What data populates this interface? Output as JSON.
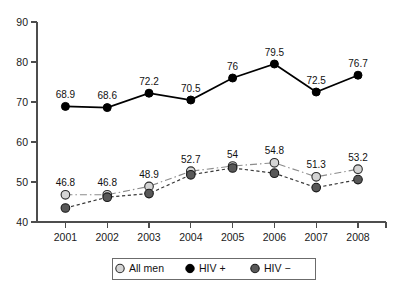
{
  "chart_data": {
    "type": "line",
    "title": "",
    "subtitle": "",
    "xlabel": "",
    "ylabel": "",
    "categories": [
      "2001",
      "2002",
      "2003",
      "2004",
      "2005",
      "2006",
      "2007",
      "2008"
    ],
    "x": [
      2001,
      2002,
      2003,
      2004,
      2005,
      2006,
      2007,
      2008
    ],
    "ylim": [
      40,
      90
    ],
    "xlim": [
      2000.5,
      2008.5
    ],
    "yticks": [
      "40",
      "50",
      "60",
      "70",
      "80",
      "90"
    ],
    "ytick_values": [
      40,
      50,
      60,
      70,
      80,
      90
    ],
    "grid": false,
    "legend_position": "bottom-center",
    "series": [
      {
        "name": "All men",
        "marker": "light-gray-circle",
        "line_style": "dash-dot",
        "color": "#d4d4d4",
        "values": [
          46.8,
          46.8,
          48.9,
          52.7,
          54.0,
          54.8,
          51.3,
          53.2
        ],
        "labels": [
          "46.8",
          "46.8",
          "48.9",
          "52.7",
          "54",
          "54.8",
          "51.3",
          "53.2"
        ],
        "labels_shown": true
      },
      {
        "name": "HIV +",
        "marker": "black-circle",
        "line_style": "solid",
        "color": "#000000",
        "values": [
          68.9,
          68.6,
          72.2,
          70.5,
          76.0,
          79.5,
          72.5,
          76.7
        ],
        "labels": [
          "68.9",
          "68.6",
          "72.2",
          "70.5",
          "76",
          "79.5",
          "72.5",
          "76.7"
        ],
        "labels_shown": true
      },
      {
        "name": "HIV −",
        "marker": "dark-gray-circle",
        "line_style": "dashed",
        "color": "#585858",
        "values": [
          43.5,
          46.2,
          47.1,
          51.8,
          53.5,
          52.2,
          48.6,
          50.6
        ],
        "labels": [],
        "labels_shown": false
      }
    ]
  },
  "legend": {
    "items": [
      {
        "label": "All men",
        "marker": "light-gray-circle"
      },
      {
        "label": "HIV +",
        "marker": "black-circle"
      },
      {
        "label": "HIV −",
        "marker": "dark-gray-circle"
      }
    ]
  },
  "colors": {
    "background": "#ffffff",
    "axis": "#4d4d4d",
    "text": "#111111",
    "all_men": "#d4d4d4",
    "hiv_positive": "#000000",
    "hiv_negative": "#585858",
    "legend_border": "#6b6b6b"
  }
}
